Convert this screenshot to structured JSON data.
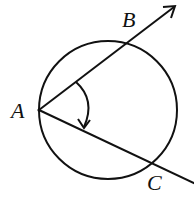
{
  "diagram": {
    "type": "geometry",
    "points": {
      "A": {
        "label": "A",
        "x": 39,
        "y": 110
      },
      "B": {
        "label": "B",
        "x": 130,
        "y": 40
      },
      "C": {
        "label": "C",
        "x": 155,
        "y": 163
      }
    },
    "circle": {
      "cx": 108,
      "cy": 110,
      "r": 69
    },
    "rays": [
      {
        "from": "A",
        "through": "B",
        "arrow": true
      },
      {
        "from": "A",
        "through": "C",
        "arrow": true
      }
    ],
    "angle_marker": {
      "vertex": "A",
      "direction": "clockwise-arrow"
    }
  }
}
